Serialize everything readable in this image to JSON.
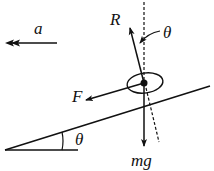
{
  "diagram": {
    "type": "free-body diagram on inclined plane",
    "labels": {
      "acceleration": "a",
      "normal_force": "R",
      "applied_force": "F",
      "weight": "mg",
      "incline_angle": "θ",
      "normal_angle": "θ"
    },
    "colors": {
      "stroke": "#111111",
      "background": "#ffffff"
    }
  }
}
